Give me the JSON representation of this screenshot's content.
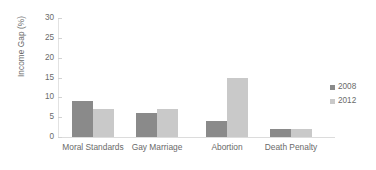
{
  "chart_data": {
    "type": "bar",
    "title": "",
    "subtitle": "",
    "xlabel": "",
    "ylabel": "Income Gap (%)",
    "ylim": [
      0,
      30
    ],
    "ytick_step": 5,
    "yticks": [
      0,
      5,
      10,
      15,
      20,
      25,
      30
    ],
    "ytick_labels": [
      "0",
      "5",
      "10",
      "15",
      "20",
      "25",
      "30"
    ],
    "grid": false,
    "legend_position": "right",
    "categories": [
      "Moral Standards",
      "Gay Marriage",
      "Abortion",
      "Death Penalty"
    ],
    "series": [
      {
        "name": "2008",
        "color": "#8a8a8a",
        "values": [
          9,
          6,
          4,
          2
        ]
      },
      {
        "name": "2012",
        "color": "#c9c9c9",
        "values": [
          7,
          7,
          15,
          2
        ]
      }
    ],
    "annotations": []
  },
  "legend": {
    "entries": [
      {
        "label": "2008",
        "swatch_name": "legend-swatch-2008"
      },
      {
        "label": "2012",
        "swatch_name": "legend-swatch-2012"
      }
    ]
  },
  "colors": {
    "series_2008": "#8a8a8a",
    "series_2012": "#c9c9c9",
    "axis": "#dcdcdc",
    "text": "#6a6a6a",
    "background": "#ffffff"
  }
}
